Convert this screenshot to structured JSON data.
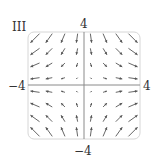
{
  "panel_label": "III",
  "axis_labels": {
    "top": "4",
    "bottom": "−4",
    "left": "−4",
    "right": "4"
  },
  "colors": {
    "frame": "#cfcfcf",
    "axis": "#8a8a8a",
    "arrow": "#555555",
    "text": "#333333"
  },
  "field": {
    "description": "F(x,y) = <x, -y>",
    "fx": "x",
    "fy": "-y",
    "grid": [
      -3.5,
      -2.5,
      -1.5,
      -0.5,
      0.5,
      1.5,
      2.5,
      3.5
    ],
    "range": [
      -4,
      4
    ]
  },
  "chart_data": {
    "type": "vector_field",
    "title": "III",
    "xlim": [
      -4,
      4
    ],
    "ylim": [
      -4,
      4
    ],
    "tick_labels": {
      "x": [
        "−4",
        "4"
      ],
      "y": [
        "−4",
        "4"
      ]
    },
    "field": "F(x,y) = (x, -y)",
    "grid_points_per_axis": 8
  }
}
